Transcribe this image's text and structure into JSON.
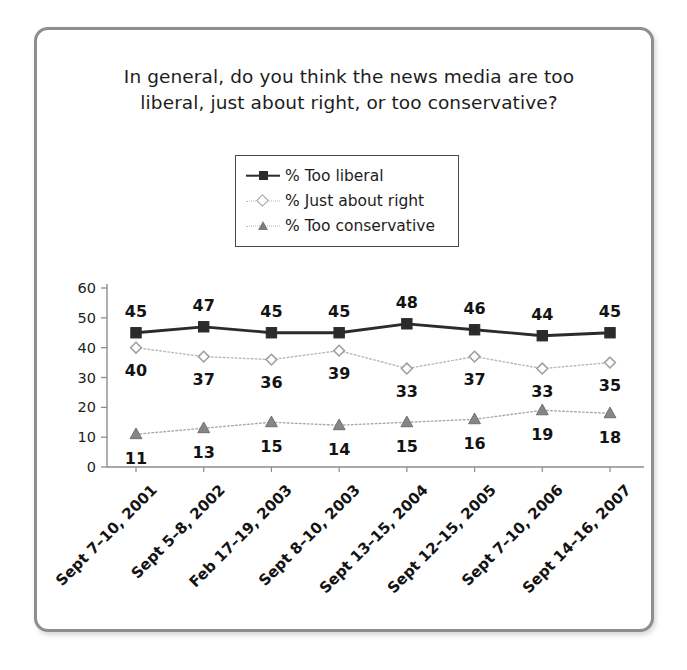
{
  "chart_data": {
    "type": "line",
    "title": "In general, do you think the news media are too liberal, just about right, or too conservative?",
    "title_line1": "In general, do you think the news media are too",
    "title_line2": "liberal, just about right, or too conservative?",
    "xlabel": "",
    "ylabel": "",
    "ylim": [
      0,
      60
    ],
    "yticks": [
      60,
      50,
      40,
      30,
      20,
      10,
      0
    ],
    "grid": false,
    "legend_position": "top-center",
    "categories": [
      "Sept 7–10, 2001",
      "Sept 5–8, 2002",
      "Feb 17–19, 2003",
      "Sept 8–10, 2003",
      "Sept 13–15, 2004",
      "Sept 12–15, 2005",
      "Sept 7–10, 2006",
      "Sept 14–16, 2007"
    ],
    "series": [
      {
        "name": "% Too liberal",
        "marker": "square",
        "color": "#2b2b2b",
        "line_style": "solid",
        "values": [
          45,
          47,
          45,
          45,
          48,
          46,
          44,
          45
        ]
      },
      {
        "name": "% Just about right",
        "marker": "diamond",
        "color": "#b9b9b9",
        "line_style": "dotted",
        "values": [
          40,
          37,
          36,
          39,
          33,
          37,
          33,
          35
        ]
      },
      {
        "name": "% Too conservative",
        "marker": "triangle",
        "color": "#a8a8a8",
        "line_style": "dotted",
        "values": [
          11,
          13,
          15,
          14,
          15,
          16,
          19,
          18
        ]
      }
    ]
  },
  "legend": {
    "items": [
      {
        "label": "% Too liberal",
        "icon": "square-marker-icon"
      },
      {
        "label": "% Just about right",
        "icon": "diamond-marker-icon"
      },
      {
        "label": "% Too conservative",
        "icon": "triangle-marker-icon"
      }
    ]
  }
}
